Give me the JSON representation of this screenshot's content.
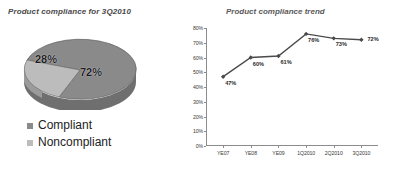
{
  "pie_panel": {
    "title": "Product compliance for 3Q2010",
    "legend": [
      {
        "label": "Compliant",
        "color": "#8a8a8a"
      },
      {
        "label": "Noncompliant",
        "color": "#bcbcbc"
      }
    ],
    "slice_labels": {
      "compliant": "72%",
      "noncompliant": "28%"
    }
  },
  "line_panel": {
    "title": "Product compliance trend"
  },
  "chart_data": [
    {
      "type": "pie",
      "title": "Product compliance for 3Q2010",
      "categories": [
        "Compliant",
        "Noncompliant"
      ],
      "values": [
        72,
        28
      ],
      "value_labels": [
        "72%",
        "28%"
      ],
      "colors": [
        "#8a8a8a",
        "#bcbcbc"
      ],
      "legend_position": "bottom-left",
      "three_d": true
    },
    {
      "type": "line",
      "title": "Product compliance trend",
      "categories": [
        "YE07",
        "YE08",
        "YE09",
        "1Q2010",
        "2Q2010",
        "3Q2010"
      ],
      "values": [
        47,
        60,
        61,
        76,
        73,
        72
      ],
      "value_labels": [
        "47%",
        "60%",
        "61%",
        "76%",
        "73%",
        "72%"
      ],
      "xlabel": "",
      "ylabel": "",
      "ylim": [
        0,
        80
      ],
      "ytick_values": [
        0,
        10,
        20,
        30,
        40,
        50,
        60,
        70,
        80
      ],
      "ytick_labels": [
        "0%",
        "10%",
        "20%",
        "30%",
        "40%",
        "50%",
        "60%",
        "70%",
        "80%"
      ],
      "grid": false,
      "legend_position": "none",
      "series_color": "#4a4a4a",
      "marker": "diamond"
    }
  ]
}
